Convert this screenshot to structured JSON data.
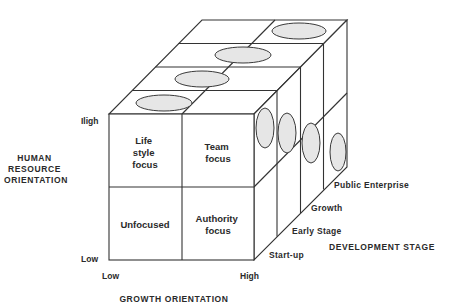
{
  "diagram": {
    "type": "3d-cube-matrix",
    "y_axis": {
      "title_lines": [
        "HUMAN",
        "RESOURCE",
        "ORIENTATION"
      ],
      "high_label": "Iligh",
      "low_label": "Low"
    },
    "x_axis": {
      "title": "GROWTH ORIENTATION",
      "low_label": "Low",
      "high_label": "High"
    },
    "z_axis": {
      "title": "DEVELOPMENT STAGE",
      "stages": [
        "Start-up",
        "Early Stage",
        "Growth",
        "Public Enterprise"
      ]
    },
    "cells": {
      "top_left": [
        "Life",
        "style",
        "focus"
      ],
      "top_right": [
        "Team",
        "focus"
      ],
      "bottom_left": [
        "Unfocused"
      ],
      "bottom_right": [
        "Authority",
        "focus"
      ]
    },
    "colors": {
      "line": "#333333",
      "oval_fill": "#e6e6e6",
      "text": "#2a2a2a",
      "background": "#ffffff"
    }
  }
}
